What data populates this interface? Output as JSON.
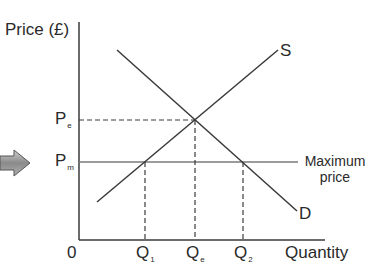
{
  "diagram": {
    "type": "supply-demand-maximum-price",
    "y_axis_label": "Price (£)",
    "x_axis_label": "Quantity",
    "origin_label": "0",
    "price_labels": {
      "equilibrium": {
        "main": "P",
        "sub": "e"
      },
      "maximum": {
        "main": "P",
        "sub": "m"
      }
    },
    "quantity_labels": {
      "q1": {
        "main": "Q",
        "sub": "1"
      },
      "qe": {
        "main": "Q",
        "sub": "e"
      },
      "q2": {
        "main": "Q",
        "sub": "2"
      }
    },
    "curves": {
      "supply": "S",
      "demand": "D"
    },
    "max_price_line_label_line1": "Maximum",
    "max_price_line_label_line2": "price",
    "colors": {
      "line": "#3a3a3a",
      "maxprice_line": "#7a7a7a",
      "arrow_fill": "#8a8a8a",
      "text": "#2a2a2a"
    }
  }
}
